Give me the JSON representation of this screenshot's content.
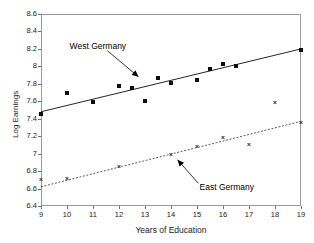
{
  "chart_data": {
    "type": "scatter",
    "title": "",
    "xlabel": "Years of Education",
    "ylabel": "Log Earnings",
    "xlim": [
      9,
      19
    ],
    "ylim": [
      6.4,
      8.6
    ],
    "grid": false,
    "legend_position": "none",
    "xticks": [
      "9",
      "10",
      "11",
      "12",
      "13",
      "14",
      "15",
      "16",
      "17",
      "18",
      "19"
    ],
    "yticks": [
      "6.4",
      "6.6",
      "6.8",
      "7",
      "7.2",
      "7.4",
      "7.6",
      "7.8",
      "8",
      "8.2",
      "8.4",
      "8.6"
    ],
    "series": [
      {
        "name": "West Germany",
        "marker": "filled-square",
        "color": "#0d0d0d",
        "line_style": "solid",
        "points": [
          {
            "x": 9,
            "y": 7.45
          },
          {
            "x": 10,
            "y": 7.69
          },
          {
            "x": 11,
            "y": 7.59
          },
          {
            "x": 12,
            "y": 7.78
          },
          {
            "x": 12.5,
            "y": 7.75
          },
          {
            "x": 13,
            "y": 7.6
          },
          {
            "x": 13.5,
            "y": 7.87
          },
          {
            "x": 14,
            "y": 7.81
          },
          {
            "x": 15,
            "y": 7.84
          },
          {
            "x": 15.5,
            "y": 7.97
          },
          {
            "x": 16,
            "y": 8.03
          },
          {
            "x": 16.5,
            "y": 8.0
          },
          {
            "x": 19,
            "y": 8.19
          }
        ],
        "fit_line": {
          "x0": 9,
          "y0": 7.48,
          "x1": 19,
          "y1": 8.2
        }
      },
      {
        "name": "East Germany",
        "marker": "cross",
        "color": "#4a4a4a",
        "line_style": "dotted",
        "points": [
          {
            "x": 9,
            "y": 6.7
          },
          {
            "x": 10,
            "y": 6.72
          },
          {
            "x": 12,
            "y": 6.855
          },
          {
            "x": 14,
            "y": 6.99
          },
          {
            "x": 15,
            "y": 7.08
          },
          {
            "x": 16,
            "y": 7.19
          },
          {
            "x": 17,
            "y": 7.11
          },
          {
            "x": 18,
            "y": 7.59
          },
          {
            "x": 19,
            "y": 7.36
          }
        ],
        "fit_line": {
          "x0": 9,
          "y0": 6.62,
          "x1": 19,
          "y1": 7.37
        }
      }
    ],
    "annotations": [
      {
        "text": "West Germany",
        "label_x": 10.1,
        "label_y": 8.23,
        "arrow_from_x": 11.55,
        "arrow_from_y": 8.18,
        "arrow_to_x": 12.75,
        "arrow_to_y": 7.88
      },
      {
        "text": "East Germany",
        "label_x": 15.1,
        "label_y": 6.62,
        "arrow_from_x": 15.05,
        "arrow_from_y": 6.66,
        "arrow_to_x": 14.25,
        "arrow_to_y": 6.93
      }
    ]
  }
}
